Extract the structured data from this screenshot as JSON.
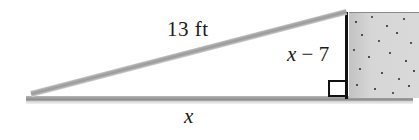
{
  "labels": {
    "hypotenuse": "13 ft",
    "vertical_leg": "x − 7",
    "vertical_leg_variable": "x",
    "vertical_leg_operator": "−",
    "vertical_leg_constant": "7",
    "base_leg": "x"
  },
  "parts": {
    "ladder_name": "ladder",
    "wall_name": "wall",
    "ground_name": "ground",
    "right_angle_name": "right angle marker"
  },
  "colors": {
    "ladder": "#a8a8a8",
    "ground": "#9d9d9d",
    "wall_fill": "#d3d3d3",
    "wall_speckle": "#4e4e4e",
    "outline": "#111111",
    "text": "#1a1a1a",
    "background": "#ffffff"
  }
}
